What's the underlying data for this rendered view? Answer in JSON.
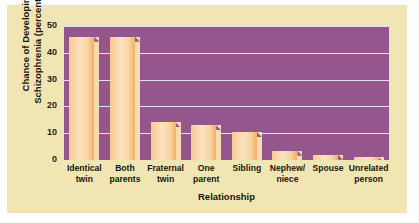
{
  "chart_data": {
    "type": "bar",
    "title": "",
    "xlabel": "Relationship",
    "ylabel": "Chance of Developing Schizophrenia (percentage)",
    "ylabel_line1": "Chance of Developing",
    "ylabel_line2": "Schizophrenia (percentage)",
    "categories": [
      "Identical twin",
      "Both parents",
      "Fraternal twin",
      "One parent",
      "Sibling",
      "Nephew/ niece",
      "Spouse",
      "Unrelated person"
    ],
    "category_lines": [
      [
        "Identical",
        "twin"
      ],
      [
        "Both",
        "parents"
      ],
      [
        "Fraternal",
        "twin"
      ],
      [
        "One",
        "parent"
      ],
      [
        "Sibling",
        ""
      ],
      [
        "Nephew/",
        "niece"
      ],
      [
        "Spouse",
        ""
      ],
      [
        "Unrelated",
        "person"
      ]
    ],
    "values": [
      46,
      46,
      14,
      13,
      10.5,
      3.5,
      2,
      1
    ],
    "yticks": [
      0,
      10,
      20,
      30,
      40,
      50
    ],
    "ytick_labels": [
      "0",
      "10",
      "20",
      "30",
      "40",
      "50"
    ],
    "ylim": [
      0,
      50
    ],
    "grid": true,
    "legend": "none",
    "colors": {
      "figure_background": "#f2e5b4",
      "plot_background": "#95568e",
      "gridline": "#e8dcf0",
      "bar_light": "#fbe3c0",
      "bar_mid": "#f6c98e",
      "bar_dark": "#f0a95c",
      "bar_bevel": "#f7dcb2",
      "text": "#16160f"
    }
  }
}
